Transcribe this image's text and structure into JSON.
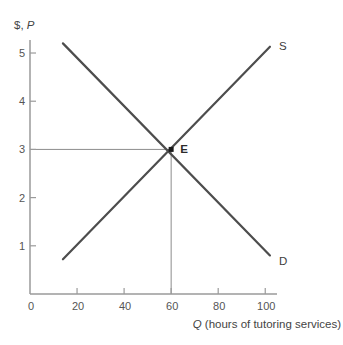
{
  "figure": {
    "width": 343,
    "height": 345
  },
  "chart_data": {
    "type": "line",
    "title": "",
    "xlabel": "Q (hours of tutoring services)",
    "ylabel": "$, P",
    "xlabel_parts": [
      {
        "text": "Q",
        "italic": true
      },
      {
        "text": " (hours of tutoring services)",
        "italic": false
      }
    ],
    "ylabel_parts": [
      {
        "text": "$, ",
        "italic": false
      },
      {
        "text": "P",
        "italic": true
      }
    ],
    "xlim": [
      0,
      105
    ],
    "ylim": [
      0,
      5.27
    ],
    "x_ticks": [
      0,
      20,
      40,
      60,
      80,
      100
    ],
    "y_ticks": [
      1,
      2,
      3,
      4,
      5
    ],
    "grid": false,
    "legend_position": "none",
    "series": [
      {
        "name": "supply",
        "label": "S",
        "points": [
          [
            14,
            0.72
          ],
          [
            102,
            5.13
          ]
        ]
      },
      {
        "name": "demand",
        "label": "D",
        "points": [
          [
            14,
            5.2
          ],
          [
            102,
            0.8
          ]
        ]
      }
    ],
    "equilibrium": {
      "label": "E",
      "q": 60,
      "p": 3
    },
    "annotations": [
      "horizontal dashed-thin line from price axis at 3 to point E",
      "vertical thin line from point E down to quantity axis at 60"
    ],
    "colors": {
      "curve": "#4d4d4d",
      "axis": "#9a9a9a",
      "tick_text": "#555555",
      "axis_label_text": "#444444",
      "connector": "#8c8c8c",
      "dot": "#1a1a1a",
      "background": "#ffffff"
    }
  }
}
